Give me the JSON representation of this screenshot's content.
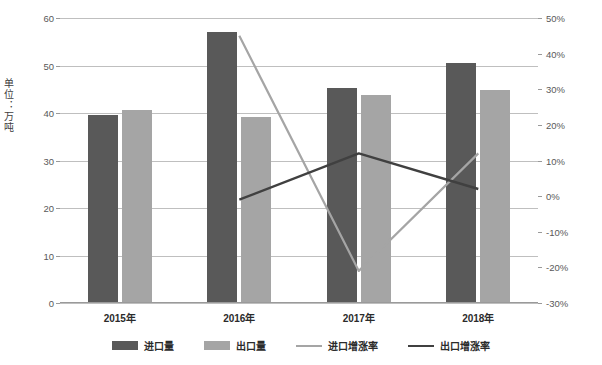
{
  "chart_data": {
    "type": "bar",
    "title": "",
    "subtitle": "",
    "xlabel": "",
    "ylabel": "单位：万吨",
    "ylabel_right": "",
    "categories": [
      "2015年",
      "2016年",
      "2017年",
      "2018年"
    ],
    "ylim": [
      0,
      60
    ],
    "ylim_right": [
      -30,
      50
    ],
    "yticks": [
      0,
      10,
      20,
      30,
      40,
      50,
      60
    ],
    "yticklabels": [
      "0",
      "10",
      "20",
      "30",
      "40",
      "50",
      "60"
    ],
    "yticks_right": [
      -30,
      -20,
      -10,
      0,
      10,
      20,
      30,
      40,
      50
    ],
    "yticklabels_right": [
      "-30%",
      "-20%",
      "-10%",
      "0%",
      "10%",
      "20%",
      "30%",
      "40%",
      "50%"
    ],
    "grid": true,
    "legend_position": "bottom",
    "series": [
      {
        "name": "进口量",
        "kind": "bar",
        "axis": "left",
        "color": "#595959",
        "values": [
          39.5,
          57.0,
          45.3,
          50.5
        ]
      },
      {
        "name": "出口量",
        "kind": "bar",
        "axis": "left",
        "color": "#a5a5a5",
        "values": [
          40.7,
          39.2,
          43.8,
          44.8
        ]
      },
      {
        "name": "进口增涨率",
        "kind": "line",
        "axis": "right",
        "color": "#a5a5a5",
        "values": [
          null,
          45,
          -21,
          12
        ]
      },
      {
        "name": "出口增涨率",
        "kind": "line",
        "axis": "right",
        "color": "#404040",
        "values": [
          null,
          -1,
          12,
          2
        ]
      }
    ]
  },
  "legend": [
    {
      "label": "进口量",
      "type": "bar",
      "color": "#595959"
    },
    {
      "label": "出口量",
      "type": "bar",
      "color": "#a5a5a5"
    },
    {
      "label": "进口增涨率",
      "type": "line",
      "color": "#a5a5a5"
    },
    {
      "label": "出口增涨率",
      "type": "line",
      "color": "#404040"
    }
  ],
  "axis_titles": {
    "left": "单位：万吨"
  }
}
